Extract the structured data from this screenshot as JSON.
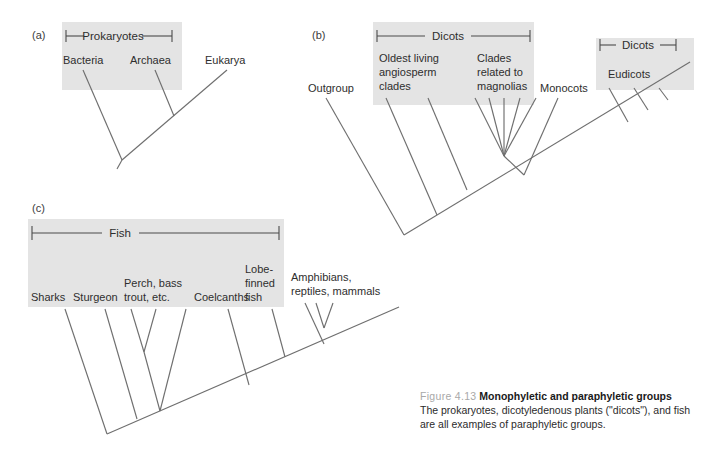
{
  "figure": {
    "number": "Figure 4.13",
    "title": "Monophyletic and paraphyletic groups",
    "body": "The prokaryotes, dicotyledenous plants (\"dicots\"), and fish are all examples of paraphyletic groups."
  },
  "colors": {
    "shade": "#e4e4e4",
    "branch": "#6f6f6f",
    "text": "#2e2e2e",
    "figure_number": "#a8a8a8"
  },
  "panels": {
    "a": {
      "letter": "(a)",
      "bracket": {
        "label": "Prokaryotes"
      },
      "tips": [
        {
          "label": "Bacteria"
        },
        {
          "label": "Archaea"
        },
        {
          "label": "Eukarya"
        }
      ]
    },
    "b": {
      "letter": "(b)",
      "brackets": [
        {
          "label": "Dicots"
        },
        {
          "label": "Dicots"
        }
      ],
      "tips": [
        {
          "label": "Outgroup"
        },
        {
          "label": "Oldest living angiosperm clades",
          "lines": [
            "Oldest living",
            "angiosperm",
            "clades"
          ]
        },
        {
          "label": "Clades related to magnolias",
          "lines": [
            "Clades",
            "related to",
            "magnolias"
          ]
        },
        {
          "label": "Monocots"
        },
        {
          "label": "Eudicots"
        }
      ]
    },
    "c": {
      "letter": "(c)",
      "bracket": {
        "label": "Fish"
      },
      "tips": [
        {
          "label": "Sharks",
          "lines": [
            "Sharks"
          ]
        },
        {
          "label": "Sturgeon",
          "lines": [
            "Sturgeon"
          ]
        },
        {
          "label": "Perch, bass trout, etc.",
          "lines": [
            "Perch, bass",
            "trout, etc."
          ]
        },
        {
          "label": "Coelcanths",
          "lines": [
            "Coelcanths"
          ]
        },
        {
          "label": "Lobe-finned fish",
          "lines": [
            "Lobe-",
            "finned",
            "fish"
          ]
        },
        {
          "label": "Amphibians, reptiles, mammals",
          "lines": [
            "Amphibians,",
            "reptiles, mammals"
          ]
        }
      ]
    }
  }
}
